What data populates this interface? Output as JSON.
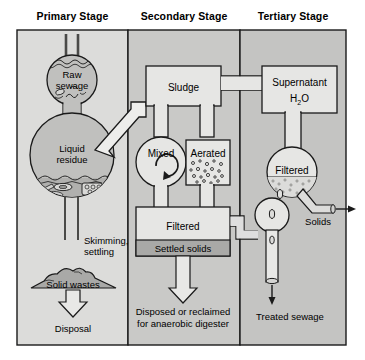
{
  "diagram": {
    "colors": {
      "panel_primary": "#dcdcda",
      "panel_secondary": "#c9c9c7",
      "panel_tertiary": "#c4c4c2",
      "vessel_fill": "#c0c0be",
      "box_fill": "#e6e6e4",
      "solids_fill": "#a9a9a7",
      "outline": "#1a1a1a",
      "text": "#000000",
      "page_background": "#ffffff"
    },
    "headers": [
      {
        "id": "primary",
        "label": "Primary Stage"
      },
      {
        "id": "secondary",
        "label": "Secondary Stage"
      },
      {
        "id": "tertiary",
        "label": "Tertiary Stage"
      }
    ],
    "primary_stage": {
      "raw_sewage_label": "Raw",
      "raw_sewage_label2": "sewage",
      "liquid_residue_label": "Liquid",
      "liquid_residue_label2": "residue",
      "skimming_label": "Skimming,",
      "skimming_label2": "settling",
      "solid_wastes_label": "Solid wastes",
      "disposal_label": "Disposal"
    },
    "secondary_stage": {
      "sludge_label": "Sludge",
      "mixed_label": "Mixed",
      "aerated_label": "Aerated",
      "filtered_label": "Filtered",
      "settled_solids_label": "Settled solids",
      "disposed_label": "Disposed or reclaimed",
      "disposed_label2": "for anaerobic digester"
    },
    "tertiary_stage": {
      "supernatant_label": "Supernatant",
      "supernatant_formula_h": "H",
      "supernatant_formula_sub": "2",
      "supernatant_formula_o": "O",
      "filtered_label": "Filtered",
      "solids_label": "Solids",
      "treated_sewage_label": "Treated sewage"
    }
  }
}
